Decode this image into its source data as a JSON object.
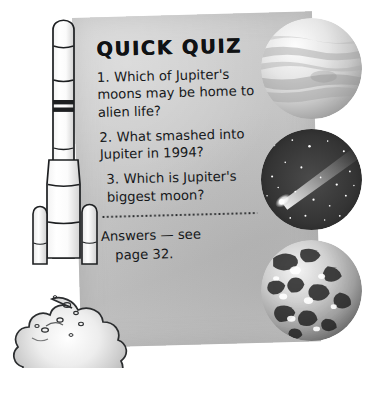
{
  "page": {
    "background_color": "#ffffff",
    "panel_color": "#c6c6c6",
    "ink_color": "#16181a"
  },
  "quiz": {
    "title": "QUICK QUIZ",
    "questions": [
      {
        "number": "1.",
        "text": "Which of Jupiter's moons may be home to alien life?"
      },
      {
        "number": "2.",
        "text": "What smashed into Jupiter in 1994?"
      },
      {
        "number": "3.",
        "text": "Which is Jupiter's biggest moon?"
      }
    ],
    "answers_line1": "Answers — see",
    "answers_line2": "page 32."
  },
  "photos": [
    {
      "name": "jupiter-planet",
      "caption": "Jupiter - pale banded gas giant"
    },
    {
      "name": "comet-starfield",
      "caption": "Comet with bright tail against stars"
    },
    {
      "name": "ganymede-moon",
      "caption": "Mottled icy moon surface"
    }
  ],
  "illustration": {
    "name": "rocket-launching",
    "caption": "White rocket with boosters lifting off in a cloud of exhaust smoke"
  }
}
